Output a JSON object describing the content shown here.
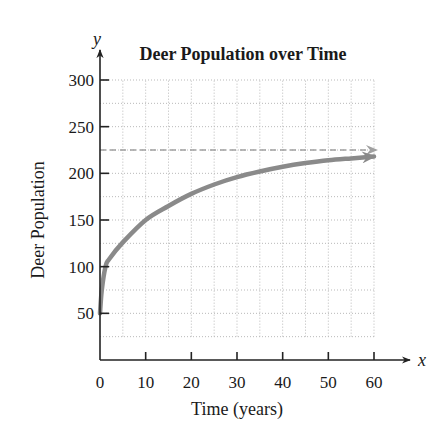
{
  "chart_data": {
    "type": "line",
    "title": "Deer Population over Time",
    "xlabel": "Time (years)",
    "ylabel": "Deer Population",
    "x_axis_variable": "x",
    "y_axis_variable": "y",
    "xlim": [
      0,
      60
    ],
    "ylim": [
      0,
      300
    ],
    "x_ticks": [
      0,
      10,
      20,
      30,
      40,
      50,
      60
    ],
    "y_ticks": [
      50,
      100,
      150,
      200,
      250,
      300
    ],
    "grid": true,
    "grid_x_step": 5,
    "grid_y_step": 25,
    "series": [
      {
        "name": "Deer population",
        "style": "solid-arrow",
        "color": "#8a8a8a",
        "x": [
          0,
          0.4,
          1.2,
          2,
          5,
          10,
          15,
          20,
          25,
          30,
          35,
          40,
          45,
          50,
          55,
          60
        ],
        "values": [
          50,
          75,
          100,
          108,
          126,
          150,
          165,
          178,
          188,
          196,
          202,
          207,
          211,
          214,
          216,
          218
        ]
      },
      {
        "name": "Carrying capacity (asymptote)",
        "style": "dashed-arrow",
        "color": "#a0a0a0",
        "x": [
          0,
          60
        ],
        "values": [
          225,
          225
        ]
      }
    ]
  },
  "labels": {
    "title": "Deer Population over Time",
    "xlabel": "Time (years)",
    "ylabel": "Deer Population",
    "x_var": "x",
    "y_var": "y"
  }
}
